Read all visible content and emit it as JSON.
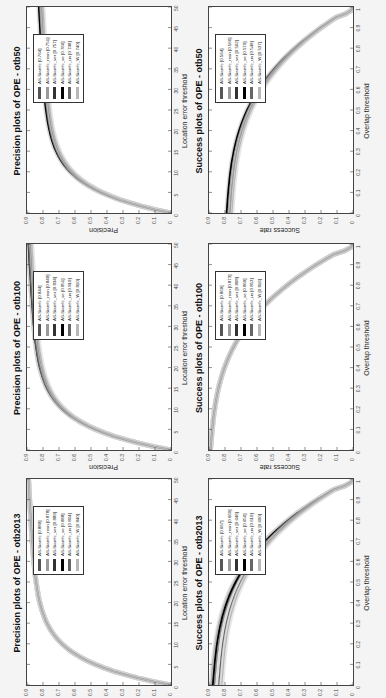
{
  "chart_data": [
    {
      "type": "line",
      "id": "prec_otb2013",
      "title": "Precision plots of OPE - otb2013",
      "xlabel": "Location error threshold",
      "ylabel": "Precision",
      "xlim": [
        0,
        50
      ],
      "ylim": [
        0,
        0.9
      ],
      "xticks": [
        "0",
        "5",
        "10",
        "15",
        "20",
        "25",
        "30",
        "35",
        "40",
        "45",
        "50"
      ],
      "yticks": [
        "0",
        "0.1",
        "0.2",
        "0.3",
        "0.4",
        "0.5",
        "0.6",
        "0.7",
        "0.8",
        "0.9"
      ],
      "legend_position": "inside upper-left",
      "series": [
        {
          "name": "AS-Siamfc [0.889]",
          "score": 0.889,
          "color": "#555555"
        },
        {
          "name": "AS-Siamfc_resn [0.878]",
          "score": 0.878,
          "color": "#9a9a9a"
        },
        {
          "name": "AS-Siamfc_ver [0.889]",
          "score": 0.889,
          "color": "#333333"
        },
        {
          "name": "AS-Siamfc_se [0.888]",
          "score": 0.888,
          "color": "#000000"
        },
        {
          "name": "AS-Siamfc_un [0.864]",
          "score": 0.864,
          "color": "#666666"
        },
        {
          "name": "AS-Siamfc_W [0.840]",
          "score": 0.84,
          "color": "#b8b8b8"
        }
      ]
    },
    {
      "type": "line",
      "id": "prec_otb100",
      "title": "Precision plots of OPE - otb100",
      "xlabel": "Location error threshold",
      "ylabel": "Precision",
      "xlim": [
        0,
        50
      ],
      "ylim": [
        0,
        0.9
      ],
      "xticks": [
        "0",
        "5",
        "10",
        "15",
        "20",
        "25",
        "30",
        "35",
        "40",
        "45",
        "50"
      ],
      "yticks": [
        "0",
        "0.1",
        "0.2",
        "0.3",
        "0.4",
        "0.5",
        "0.6",
        "0.7",
        "0.8",
        "0.9"
      ],
      "legend_position": "inside upper-left",
      "series": [
        {
          "name": "AS-Siamfc [0.844]",
          "score": 0.844,
          "color": "#555555"
        },
        {
          "name": "AS-Siamfc_resn [0.849]",
          "score": 0.849,
          "color": "#9a9a9a"
        },
        {
          "name": "AS-Siamfc_ver [0.834]",
          "score": 0.834,
          "color": "#333333"
        },
        {
          "name": "AS-Siamfc_se [0.851]",
          "score": 0.851,
          "color": "#000000"
        },
        {
          "name": "AS-Siamfc_un [0.819]",
          "score": 0.819,
          "color": "#666666"
        },
        {
          "name": "AS-Siamfc_W [0.810]",
          "score": 0.81,
          "color": "#b8b8b8"
        }
      ]
    },
    {
      "type": "line",
      "id": "prec_otb50",
      "title": "Precision plots of OPE - otb50",
      "xlabel": "Location error threshold",
      "ylabel": "Precision",
      "xlim": [
        0,
        50
      ],
      "ylim": [
        0,
        0.9
      ],
      "xticks": [
        "0",
        "5",
        "10",
        "15",
        "20",
        "25",
        "30",
        "35",
        "40",
        "45",
        "50"
      ],
      "yticks": [
        "0",
        "0.1",
        "0.2",
        "0.3",
        "0.4",
        "0.5",
        "0.6",
        "0.7",
        "0.8",
        "0.9"
      ],
      "legend_position": "inside upper-left",
      "series": [
        {
          "name": "AS-Siamfc [0.764]",
          "score": 0.764,
          "color": "#555555"
        },
        {
          "name": "AS-Siamfc_resn [0.751]",
          "score": 0.751,
          "color": "#9a9a9a"
        },
        {
          "name": "AS-Siamfc_ver [0.757]",
          "score": 0.757,
          "color": "#333333"
        },
        {
          "name": "AS-Siamfc_se [0.766]",
          "score": 0.766,
          "color": "#000000"
        },
        {
          "name": "AS-Siamfc_un [0.748]",
          "score": 0.748,
          "color": "#666666"
        },
        {
          "name": "AS-Siamfc_W [0.740]",
          "score": 0.74,
          "color": "#b8b8b8"
        }
      ]
    },
    {
      "type": "line",
      "id": "succ_otb2013",
      "title": "Success plots of OPE - otb2013",
      "xlabel": "Overlap threshold",
      "ylabel": "Success rate",
      "xlim": [
        0,
        1
      ],
      "ylim": [
        0,
        0.9
      ],
      "xticks": [
        "0",
        "0.1",
        "0.2",
        "0.3",
        "0.4",
        "0.5",
        "0.6",
        "0.7",
        "0.8",
        "0.9",
        "1"
      ],
      "yticks": [
        "0",
        "0.1",
        "0.2",
        "0.3",
        "0.4",
        "0.5",
        "0.6",
        "0.7",
        "0.8",
        "0.9"
      ],
      "legend_position": "inside upper-left",
      "series": [
        {
          "name": "AS-Siamfc [0.667]",
          "score": 0.667,
          "color": "#555555"
        },
        {
          "name": "AS-Siamfc_resn [0.660]",
          "score": 0.66,
          "color": "#9a9a9a"
        },
        {
          "name": "AS-Siamfc_ver [0.646]",
          "score": 0.646,
          "color": "#333333"
        },
        {
          "name": "AS-Siamfc_se [0.656]",
          "score": 0.656,
          "color": "#000000"
        },
        {
          "name": "AS-Siamfc_un [0.619]",
          "score": 0.619,
          "color": "#666666"
        },
        {
          "name": "AS-Siamfc_W [0.600]",
          "score": 0.6,
          "color": "#b8b8b8"
        }
      ]
    },
    {
      "type": "line",
      "id": "succ_otb100",
      "title": "Success plots of OPE - otb100",
      "xlabel": "Overlap threshold",
      "ylabel": "Success rate",
      "xlim": [
        0,
        1
      ],
      "ylim": [
        0,
        0.9
      ],
      "xticks": [
        "0",
        "0.1",
        "0.2",
        "0.3",
        "0.4",
        "0.5",
        "0.6",
        "0.7",
        "0.8",
        "0.9",
        "1"
      ],
      "yticks": [
        "0",
        "0.1",
        "0.2",
        "0.3",
        "0.4",
        "0.5",
        "0.6",
        "0.7",
        "0.8",
        "0.9"
      ],
      "legend_position": "inside upper-left",
      "series": [
        {
          "name": "AS-Siamfc [0.869]",
          "score": 0.869,
          "color": "#555555"
        },
        {
          "name": "AS-Siamfc_resn [0.873]",
          "score": 0.873,
          "color": "#9a9a9a"
        },
        {
          "name": "AS-Siamfc_ver [0.868]",
          "score": 0.868,
          "color": "#333333"
        },
        {
          "name": "AS-Siamfc_se [0.869]",
          "score": 0.869,
          "color": "#000000"
        },
        {
          "name": "AS-Siamfc_un [0.853]",
          "score": 0.853,
          "color": "#666666"
        },
        {
          "name": "AS-Siamfc_W [0.816]",
          "score": 0.816,
          "color": "#b8b8b8"
        }
      ]
    },
    {
      "type": "line",
      "id": "succ_otb50",
      "title": "Success plots of OPE - otb50",
      "xlabel": "Overlap threshold",
      "ylabel": "Success rate",
      "xlim": [
        0,
        1
      ],
      "ylim": [
        0,
        0.9
      ],
      "xticks": [
        "0",
        "0.1",
        "0.2",
        "0.3",
        "0.4",
        "0.5",
        "0.6",
        "0.7",
        "0.8",
        "0.9",
        "1"
      ],
      "yticks": [
        "0",
        "0.1",
        "0.2",
        "0.3",
        "0.4",
        "0.5",
        "0.6",
        "0.7",
        "0.8",
        "0.9"
      ],
      "legend_position": "inside upper-left",
      "series": [
        {
          "name": "AS-Siamfc [0.564]",
          "score": 0.564,
          "color": "#555555"
        },
        {
          "name": "AS-Siamfc_resn [0.566]",
          "score": 0.566,
          "color": "#9a9a9a"
        },
        {
          "name": "AS-Siamfc_ver [0.562]",
          "score": 0.562,
          "color": "#333333"
        },
        {
          "name": "AS-Siamfc_se [0.570]",
          "score": 0.57,
          "color": "#000000"
        },
        {
          "name": "AS-Siamfc_un [0.549]",
          "score": 0.549,
          "color": "#666666"
        },
        {
          "name": "AS-Siamfc_W [0.537]",
          "score": 0.537,
          "color": "#b8b8b8"
        }
      ]
    }
  ],
  "layout": {
    "orientation": "figure rotated 90 degrees counter-clockwise",
    "grid": "2 rows x 3 columns",
    "rows": [
      "Precision",
      "Success"
    ],
    "columns": [
      "otb2013",
      "otb100",
      "otb50"
    ],
    "gridlines": false
  }
}
